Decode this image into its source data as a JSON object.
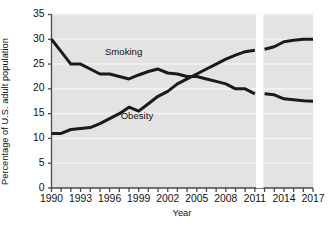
{
  "chart_data": {
    "type": "line",
    "title": "",
    "subtitle": "",
    "xlabel": "Year",
    "ylabel": "Percentage of U.S. adult population",
    "xlim": [
      1990,
      2017
    ],
    "ylim": [
      0,
      35
    ],
    "yticks": [
      0,
      5,
      10,
      15,
      20,
      25,
      30,
      35
    ],
    "xticks_labeled": [
      1990,
      1993,
      1996,
      1999,
      2002,
      2005,
      2008,
      2011,
      2014,
      2017
    ],
    "xticks_all": [
      1990,
      1991,
      1992,
      1993,
      1994,
      1995,
      1996,
      1997,
      1998,
      1999,
      2000,
      2001,
      2002,
      2003,
      2004,
      2005,
      2006,
      2007,
      2008,
      2009,
      2010,
      2011,
      2012,
      2013,
      2014,
      2015,
      2016,
      2017
    ],
    "grid": true,
    "grid_orientation": "horizontal",
    "plot_background": "#e3e3e3",
    "grid_color": "#f2f2f2",
    "line_color": "#1a1a1a",
    "line_width": 3,
    "legend_position": "inline-annotation",
    "data_break": {
      "present": true,
      "after_year": 2011,
      "resume_year": 2012,
      "note": "vertical white gap between 2011 and 2012"
    },
    "x": [
      1990,
      1991,
      1992,
      1993,
      1994,
      1995,
      1996,
      1997,
      1998,
      1999,
      2000,
      2001,
      2002,
      2003,
      2004,
      2005,
      2006,
      2007,
      2008,
      2009,
      2010,
      2011,
      2012,
      2013,
      2014,
      2015,
      2016,
      2017
    ],
    "series": [
      {
        "name": "Smoking",
        "label_x": 1998,
        "label_y": 27.5,
        "values": [
          30.0,
          27.5,
          25.0,
          25.0,
          24.0,
          23.0,
          23.0,
          22.5,
          22.0,
          22.8,
          23.5,
          24.0,
          23.2,
          23.0,
          22.5,
          22.5,
          22.0,
          21.5,
          21.0,
          20.0,
          20.0,
          19.0,
          19.0,
          18.8,
          18.0,
          17.8,
          17.6,
          17.5
        ],
        "segments": [
          {
            "from": 1990,
            "to": 2011
          },
          {
            "from": 2012,
            "to": 2017
          }
        ]
      },
      {
        "name": "Obesity",
        "label_x": 1999,
        "label_y": 14.5,
        "values": [
          11.0,
          11.0,
          11.8,
          12.0,
          12.2,
          13.0,
          14.0,
          15.0,
          16.3,
          15.5,
          17.0,
          18.5,
          19.5,
          21.0,
          22.0,
          23.0,
          24.0,
          25.0,
          26.0,
          26.8,
          27.5,
          27.8,
          28.0,
          28.5,
          29.5,
          29.8,
          30.0,
          30.0
        ],
        "segments": [
          {
            "from": 1990,
            "to": 2011
          },
          {
            "from": 2012,
            "to": 2017
          }
        ]
      }
    ]
  },
  "axis": {
    "y_title": "Percentage of U.S. adult population",
    "x_title": "Year",
    "y_tick_labels": [
      "35",
      "30",
      "25",
      "20",
      "15",
      "10",
      "5",
      "0"
    ],
    "x_tick_labels": [
      "1990",
      "1993",
      "1996",
      "1999",
      "2002",
      "2005",
      "2008",
      "2011",
      "2014",
      "2017"
    ]
  },
  "annotations": {
    "smoking_label": "Smoking",
    "obesity_label": "Obesity"
  },
  "colors": {
    "line": "#1a1a1a",
    "plot_bg": "#e3e3e3",
    "gridline": "#f4f4f4",
    "axis": "#4a4a4a",
    "text": "#111111",
    "page_bg": "#ffffff"
  }
}
